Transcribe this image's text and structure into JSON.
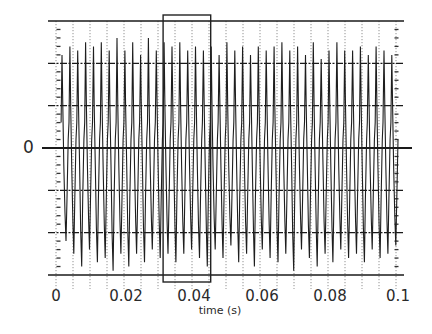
{
  "chart_data": {
    "type": "line",
    "title": "",
    "xlabel": "time (s)",
    "ylabel": "",
    "y_labels": [
      "0"
    ],
    "x_ticks": [
      0,
      0.02,
      0.04,
      0.06,
      0.08,
      0.1
    ],
    "x_tick_labels": [
      "0",
      "0.02",
      "0.04",
      "0.06",
      "0.08",
      "0.1"
    ],
    "xlim": [
      0,
      0.1
    ],
    "ylim": [
      -3,
      3
    ],
    "grid": {
      "horizontal_solid": [
        -3,
        -2,
        -1,
        0,
        1,
        2,
        3
      ],
      "vertical_dotted_step_s": 0.005
    },
    "series": [
      {
        "name": "waveform",
        "description": "Periodic oscillating signal (~430 cycles/s) with sharp peaks; peak amplitude varying roughly 2.1-2.7 units, trough amplitude roughly 2.1-2.9 units",
        "approx_frequency_hz": 430,
        "approx_cycles": 43,
        "peak_amplitudes": [
          2.2,
          2.4,
          2.3,
          2.5,
          2.4,
          2.5,
          2.3,
          2.6,
          2.3,
          2.5,
          2.2,
          2.6,
          2.3,
          2.5,
          2.4,
          2.5,
          2.3,
          2.4,
          2.3,
          2.4,
          2.2,
          2.5,
          2.3,
          2.4,
          2.2,
          2.4,
          2.3,
          2.4,
          2.5,
          2.3,
          2.4,
          2.2,
          2.5,
          2.1,
          2.3,
          2.5,
          2.3,
          2.3,
          2.4,
          2.2,
          2.4,
          2.3,
          2.2
        ],
        "trough_amplitudes": [
          -2.2,
          -2.5,
          -2.8,
          -2.4,
          -2.7,
          -2.6,
          -2.9,
          -2.5,
          -2.8,
          -2.5,
          -2.7,
          -2.4,
          -2.6,
          -2.5,
          -2.7,
          -2.5,
          -2.4,
          -2.6,
          -2.8,
          -2.4,
          -2.6,
          -2.3,
          -2.7,
          -2.5,
          -2.8,
          -2.4,
          -2.6,
          -2.7,
          -2.5,
          -2.9,
          -2.4,
          -2.6,
          -2.8,
          -2.5,
          -2.7,
          -2.4,
          -2.6,
          -2.5,
          -2.7,
          -2.4,
          -2.6,
          -2.5,
          -2.3
        ]
      }
    ],
    "annotations": [
      {
        "type": "selection-rectangle",
        "x_start_s": 0.0315,
        "x_end_s": 0.0455,
        "note": "rectangle spanning full plot height, slightly beyond top and bottom axes"
      }
    ],
    "legend": null
  }
}
